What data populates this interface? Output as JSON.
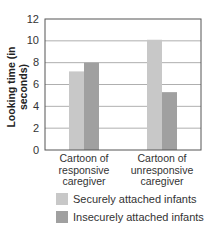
{
  "chart_data": {
    "type": "bar",
    "title": "",
    "xlabel": "",
    "ylabel": "Looking time (in seconds)",
    "ylim": [
      0,
      12
    ],
    "yticks": [
      0,
      2,
      4,
      6,
      8,
      10,
      12
    ],
    "grid": true,
    "legend_position": "bottom",
    "categories": [
      "Cartoon of responsive caregiver",
      "Cartoon of unresponsive caregiver"
    ],
    "category_lines": [
      [
        "Cartoon of",
        "responsive",
        "caregiver"
      ],
      [
        "Cartoon of",
        "unresponsive",
        "caregiver"
      ]
    ],
    "series": [
      {
        "name": "Securely attached infants",
        "color": "#c8c8c8",
        "values": [
          7.2,
          10.1
        ]
      },
      {
        "name": "Insecurely attached infants",
        "color": "#a0a0a0",
        "values": [
          8.0,
          5.3
        ]
      }
    ]
  },
  "labels": {
    "ylabel": "Looking time (in seconds)",
    "cat0_l0": "Cartoon of",
    "cat0_l1": "responsive",
    "cat0_l2": "caregiver",
    "cat1_l0": "Cartoon of",
    "cat1_l1": "unresponsive",
    "cat1_l2": "caregiver",
    "legend0": "Securely attached infants",
    "legend1": "Insecurely attached infants"
  }
}
